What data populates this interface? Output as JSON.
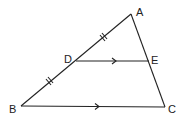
{
  "diagram": {
    "type": "triangle-midpoint",
    "points": {
      "A": {
        "label": "A",
        "x": 131,
        "y": 14
      },
      "B": {
        "label": "B",
        "x": 21,
        "y": 106
      },
      "C": {
        "label": "C",
        "x": 165,
        "y": 107
      },
      "D": {
        "label": "D",
        "x": 76,
        "y": 61
      },
      "E": {
        "label": "E",
        "x": 149,
        "y": 61
      }
    },
    "segments": [
      "AB",
      "AC",
      "BC",
      "DE"
    ],
    "parallel_marks": [
      "DE",
      "BC"
    ],
    "equal_marks": [
      "AD",
      "DB"
    ],
    "colors": {
      "stroke": "#222222",
      "background": "#ffffff"
    }
  }
}
